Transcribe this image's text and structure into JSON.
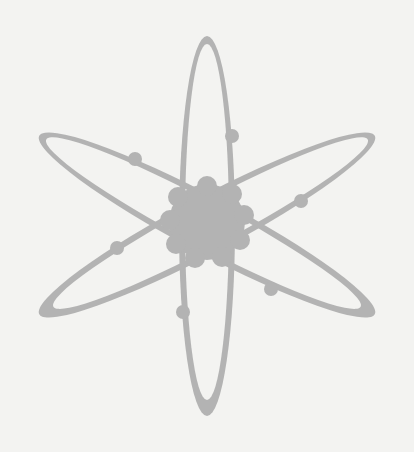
{
  "image": {
    "subject": "atom symbol",
    "label": "Atom icon with three elliptical orbits, a central nucleus and six electrons"
  },
  "colors": {
    "background": "#f3f3f1",
    "symbol": "#b3b3b3"
  },
  "atom": {
    "center": [
      207,
      223
    ],
    "nucleus_radius": 42,
    "orbit_count": 3,
    "electron_count": 6
  }
}
